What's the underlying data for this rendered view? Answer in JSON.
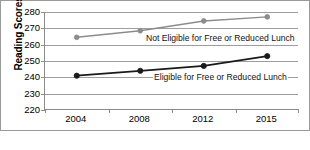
{
  "chart_data": {
    "type": "line",
    "title": "",
    "xlabel": "",
    "ylabel": "Reading Scores",
    "categories": [
      "2004",
      "2008",
      "2012",
      "2015"
    ],
    "ylim": [
      220,
      280
    ],
    "yticks": [
      220,
      230,
      240,
      250,
      260,
      270,
      280
    ],
    "grid": true,
    "legend_position": "inline-annotation",
    "series": [
      {
        "name": "Not Eligible for Free or Reduced Lunch",
        "values": [
          264.5,
          268.5,
          274.5,
          277
        ],
        "color": "#8c8c8c",
        "marker": "circle"
      },
      {
        "name": "Eligible for Free or Reduced Lunch",
        "values": [
          241,
          244,
          247,
          253
        ],
        "color": "#1a1a1a",
        "marker": "circle"
      }
    ],
    "annotations": [
      {
        "text": "Not Eligible for Free or Reduced Lunch",
        "series": 0
      },
      {
        "text": "Eligible for Free or Reduced Lunch",
        "series": 1
      }
    ]
  },
  "axis": {
    "y_label": "Reading Scores",
    "y_tick_labels": [
      "280",
      "270",
      "260",
      "250",
      "240",
      "230",
      "220"
    ],
    "x_tick_labels": [
      "2004",
      "2008",
      "2012",
      "2015"
    ]
  },
  "colors": {
    "series_not_eligible": "#8c8c8c",
    "series_eligible": "#1a1a1a",
    "gridline": "#9d9d9d",
    "axis": "#8c8c8c",
    "frame": "#9a9a9a",
    "background": "#ffffff"
  },
  "labels": {
    "not_eligible": "Not Eligible for Free or Reduced Lunch",
    "eligible": "Eligible for Free or Reduced Lunch"
  }
}
